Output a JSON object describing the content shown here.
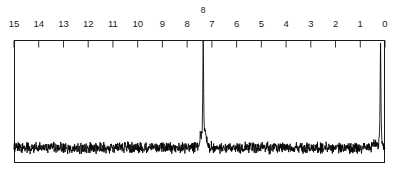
{
  "figure": {
    "kind": "nmr-spectrum",
    "background_color": "#ffffff",
    "trace_color": "#000000",
    "frame_color": "#1a1a1a",
    "width": 397,
    "height": 175
  },
  "plot_frame": {
    "left": 14,
    "right": 385,
    "top": 40,
    "bottom": 163
  },
  "annotations": [
    {
      "name": "peak-count-label",
      "text": "8",
      "ppm": 7.35
    }
  ],
  "chart_data": {
    "type": "line",
    "title": "",
    "xlabel": "",
    "ylabel": "",
    "xlim": [
      15,
      0
    ],
    "ylim": [
      0,
      1
    ],
    "grid": false,
    "legend": "none",
    "x_axis_direction": "reversed",
    "tick_labels": [
      "15",
      "14",
      "13",
      "12",
      "11",
      "10",
      "9",
      "8",
      "7",
      "6",
      "5",
      "4",
      "3",
      "2",
      "1",
      "0"
    ],
    "tick_values": [
      15,
      14,
      13,
      12,
      11,
      10,
      9,
      8,
      7,
      6,
      5,
      4,
      3,
      2,
      1,
      0
    ],
    "baseline_level": 0.12,
    "noise_amplitude": 0.045,
    "peaks": [
      {
        "ppm": 7.35,
        "height": 1.0,
        "width": 0.035,
        "label": "8"
      },
      {
        "ppm": 0.18,
        "height": 1.0,
        "width": 0.035,
        "label": ""
      },
      {
        "ppm": 7.25,
        "height": 0.12,
        "width": 0.09,
        "label": ""
      },
      {
        "ppm": 7.45,
        "height": 0.09,
        "width": 0.08,
        "label": ""
      },
      {
        "ppm": 0.45,
        "height": 0.08,
        "width": 0.07,
        "label": ""
      }
    ],
    "series": [
      {
        "name": "1H NMR trace",
        "description": "noisy baseline with two tall resonances"
      }
    ]
  }
}
